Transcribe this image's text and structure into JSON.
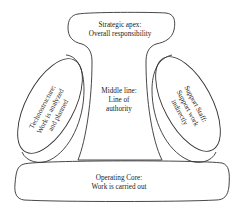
{
  "diagram": {
    "colors": {
      "stroke": "#333333",
      "text": "#222222",
      "background": "#ffffff"
    },
    "parts": {
      "strategic_apex": {
        "line1": "Strategic apex:",
        "line2": "Overall responsibility"
      },
      "middle_line": {
        "line1": "Middle line:",
        "line2": "Line of",
        "line3": "authority"
      },
      "technostructure": {
        "line1": "Technostructure:",
        "line2": "Work is analyzed",
        "line3": "and planned"
      },
      "support_staff": {
        "line1": "Support Staff:",
        "line2": "Support work",
        "line3": "indirectly"
      },
      "operating_core": {
        "line1": "Operating Core:",
        "line2": "Work is carried out"
      }
    }
  }
}
